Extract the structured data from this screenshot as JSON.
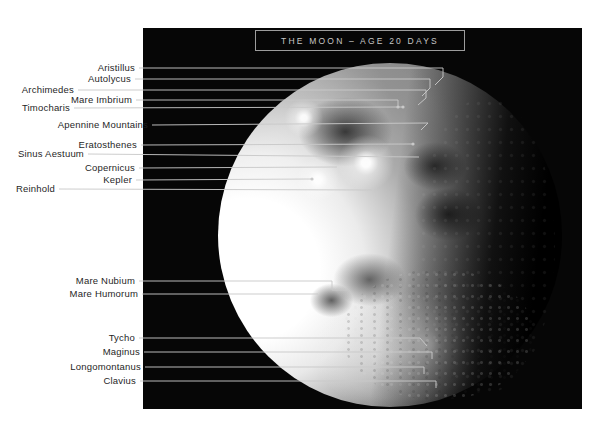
{
  "title": "THE MOON – AGE 20 DAYS",
  "colors": {
    "page_bg": "#ffffff",
    "photo_bg": "#060606",
    "leader_line": "#c9c9c9",
    "label_text": "#1f1f1f",
    "title_text": "#c6c6c6",
    "title_border": "#9c9c9c"
  },
  "photo": {
    "left": 143,
    "top": 28,
    "width": 439,
    "height": 381
  },
  "labels": [
    {
      "id": "aristillus",
      "text": "Aristillus",
      "text_right": 135,
      "y": 68,
      "line": [
        [
          139,
          68
        ],
        [
          443,
          68
        ],
        [
          443,
          77
        ],
        [
          435,
          85
        ]
      ]
    },
    {
      "id": "autolycus",
      "text": "Autolycus",
      "text_right": 131,
      "y": 79,
      "line": [
        [
          135,
          79
        ],
        [
          430,
          79
        ],
        [
          430,
          88
        ],
        [
          422,
          96
        ]
      ]
    },
    {
      "id": "archimedes",
      "text": "Archimedes",
      "text_right": 74,
      "y": 90,
      "line": [
        [
          78,
          90
        ],
        [
          426,
          90
        ],
        [
          426,
          98
        ],
        [
          418,
          105
        ]
      ]
    },
    {
      "id": "mare-imbrium",
      "text": "Mare Imbrium",
      "text_right": 132,
      "y": 100,
      "line": [
        [
          136,
          100
        ],
        [
          398,
          100
        ],
        [
          398,
          106
        ]
      ],
      "dot": [
        398,
        107
      ]
    },
    {
      "id": "timocharis",
      "text": "Timocharis",
      "text_right": 70,
      "y": 108,
      "line": [
        [
          74,
          108
        ],
        [
          402,
          107
        ]
      ],
      "dot": [
        403,
        107
      ]
    },
    {
      "id": "apennine-mountains",
      "text": "Apennine Mountains",
      "text_right": 148,
      "y": 125,
      "line": [
        [
          152,
          125
        ],
        [
          428,
          123
        ],
        [
          421,
          130
        ]
      ]
    },
    {
      "id": "eratosthenes",
      "text": "Eratosthenes",
      "text_right": 137,
      "y": 145,
      "line": [
        [
          141,
          145
        ],
        [
          412,
          144
        ]
      ],
      "dot": [
        413,
        144
      ]
    },
    {
      "id": "sinus-aestuum",
      "text": "Sinus Aestuum",
      "text_right": 84,
      "y": 154,
      "line": [
        [
          88,
          154
        ],
        [
          419,
          157
        ]
      ]
    },
    {
      "id": "copernicus",
      "text": "Copernicus",
      "text_right": 135,
      "y": 168,
      "line": [
        [
          139,
          168
        ],
        [
          337,
          167
        ]
      ]
    },
    {
      "id": "kepler",
      "text": "Kepler",
      "text_right": 132,
      "y": 180,
      "line": [
        [
          136,
          180
        ],
        [
          311,
          179
        ]
      ],
      "dot": [
        312,
        179
      ]
    },
    {
      "id": "reinhold",
      "text": "Reinhold",
      "text_right": 55,
      "y": 189,
      "line": [
        [
          59,
          189
        ],
        [
          372,
          190
        ]
      ]
    },
    {
      "id": "mare-nubium",
      "text": "Mare Nubium",
      "text_right": 135,
      "y": 281,
      "line": [
        [
          139,
          281
        ],
        [
          332,
          281
        ],
        [
          332,
          290
        ],
        [
          347,
          290
        ]
      ]
    },
    {
      "id": "mare-humorum",
      "text": "Mare Humorum",
      "text_right": 138,
      "y": 294,
      "line": [
        [
          142,
          294
        ],
        [
          318,
          294
        ]
      ]
    },
    {
      "id": "tycho",
      "text": "Tycho",
      "text_right": 135,
      "y": 338,
      "line": [
        [
          139,
          338
        ],
        [
          420,
          338
        ],
        [
          427,
          346
        ]
      ]
    },
    {
      "id": "maginus",
      "text": "Maginus",
      "text_right": 140,
      "y": 352,
      "line": [
        [
          144,
          352
        ],
        [
          432,
          352
        ],
        [
          432,
          359
        ]
      ]
    },
    {
      "id": "longomontanus",
      "text": "Longomontanus",
      "text_right": 141,
      "y": 367,
      "line": [
        [
          145,
          367
        ],
        [
          424,
          367
        ],
        [
          424,
          374
        ]
      ]
    },
    {
      "id": "clavius",
      "text": "Clavius",
      "text_right": 136,
      "y": 381,
      "line": [
        [
          140,
          381
        ],
        [
          436,
          381
        ],
        [
          436,
          388
        ]
      ]
    }
  ]
}
